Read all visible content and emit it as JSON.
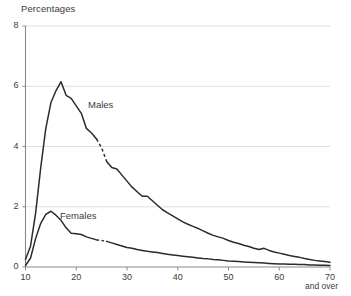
{
  "chart_data": {
    "type": "line",
    "title": "Percentages",
    "xlabel": "",
    "ylabel": "Percentages",
    "xlim": [
      10,
      70
    ],
    "ylim": [
      0,
      8
    ],
    "grid": true,
    "legend_position": "inline-annotations",
    "xticks": [
      10,
      20,
      30,
      40,
      50,
      60,
      70
    ],
    "yticks": [
      0,
      2,
      4,
      6,
      8
    ],
    "xtick_labels": [
      "10",
      "20",
      "30",
      "40",
      "50",
      "60",
      "70"
    ],
    "ytick_labels": [
      "0",
      "2",
      "4",
      "6",
      "8"
    ],
    "annotations": [
      {
        "text": "Percentages",
        "role": "axis-title",
        "x": 10,
        "y": 8.6
      },
      {
        "text": "and over",
        "role": "axis-note",
        "x": 70,
        "y": -0.9
      },
      {
        "text": "Males",
        "role": "series-label",
        "x": 23.5,
        "y": 5.15
      },
      {
        "text": "Females",
        "role": "series-label",
        "x": 21.5,
        "y": 1.6
      }
    ],
    "series": [
      {
        "name": "Males",
        "label": "Males",
        "color": "#2b2b2b",
        "dashed_segment_x": [
          24,
          26
        ],
        "x": [
          10,
          11,
          12,
          13,
          14,
          15,
          16,
          17,
          18,
          19,
          20,
          21,
          22,
          23,
          24,
          25,
          26,
          27,
          28,
          29,
          30,
          31,
          32,
          33,
          34,
          35,
          36,
          37,
          38,
          39,
          40,
          41,
          42,
          43,
          44,
          45,
          46,
          47,
          48,
          49,
          50,
          51,
          52,
          53,
          54,
          55,
          56,
          57,
          58,
          59,
          60,
          61,
          62,
          63,
          64,
          65,
          66,
          67,
          68,
          69,
          70
        ],
        "values": [
          0.25,
          0.7,
          1.8,
          3.3,
          4.6,
          5.45,
          5.85,
          6.15,
          5.7,
          5.6,
          5.35,
          5.1,
          4.6,
          4.45,
          4.25,
          3.95,
          3.5,
          3.3,
          3.25,
          3.05,
          2.85,
          2.65,
          2.5,
          2.35,
          2.35,
          2.2,
          2.05,
          1.9,
          1.8,
          1.7,
          1.6,
          1.5,
          1.42,
          1.35,
          1.28,
          1.2,
          1.12,
          1.05,
          1.0,
          0.95,
          0.88,
          0.82,
          0.78,
          0.72,
          0.68,
          0.62,
          0.58,
          0.62,
          0.55,
          0.5,
          0.46,
          0.42,
          0.38,
          0.35,
          0.32,
          0.28,
          0.25,
          0.22,
          0.2,
          0.18,
          0.16
        ]
      },
      {
        "name": "Females",
        "label": "Females",
        "color": "#2b2b2b",
        "dashed_segment_x": [
          24,
          25.5
        ],
        "x": [
          10,
          11,
          12,
          13,
          14,
          15,
          16,
          17,
          18,
          19,
          20,
          21,
          22,
          23,
          24,
          25,
          26,
          27,
          28,
          29,
          30,
          31,
          32,
          33,
          34,
          35,
          36,
          37,
          38,
          39,
          40,
          41,
          42,
          43,
          44,
          45,
          46,
          47,
          48,
          49,
          50,
          51,
          52,
          53,
          54,
          55,
          56,
          57,
          58,
          59,
          60,
          61,
          62,
          63,
          64,
          65,
          66,
          67,
          68,
          69,
          70
        ],
        "values": [
          0.05,
          0.3,
          0.95,
          1.45,
          1.75,
          1.85,
          1.72,
          1.55,
          1.3,
          1.12,
          1.1,
          1.08,
          1.0,
          0.95,
          0.9,
          0.88,
          0.85,
          0.8,
          0.75,
          0.7,
          0.65,
          0.62,
          0.58,
          0.55,
          0.52,
          0.5,
          0.48,
          0.45,
          0.42,
          0.4,
          0.38,
          0.36,
          0.34,
          0.32,
          0.3,
          0.28,
          0.27,
          0.25,
          0.24,
          0.22,
          0.2,
          0.19,
          0.18,
          0.17,
          0.16,
          0.15,
          0.14,
          0.13,
          0.12,
          0.11,
          0.1,
          0.1,
          0.09,
          0.09,
          0.08,
          0.08,
          0.07,
          0.07,
          0.06,
          0.06,
          0.05
        ]
      }
    ]
  }
}
